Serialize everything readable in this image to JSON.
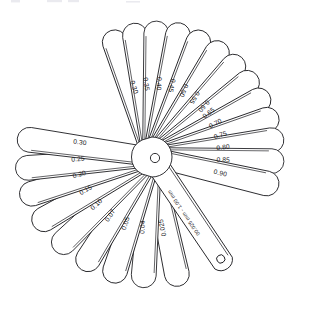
{
  "figure": {
    "object": "feeler-gauge-set",
    "background_color": "#ffffff",
    "line_color": "#1b1b1f",
    "blade_fill": "#ffffff",
    "blade_count": 21,
    "units": "mm"
  },
  "hub": {
    "name": "pivot-hub",
    "hole_label": "pivot-rivet-hole",
    "center_x": 152,
    "center_y": 157
  },
  "range_blade": {
    "name": "range-marking-blade",
    "label": "00.025 mm - 1.00 mm",
    "angle_deg": 56,
    "tip_hole": "blade-tip-hole"
  },
  "blades": [
    {
      "label": "0.30",
      "angle_deg": -108,
      "length": 133,
      "flip": true
    },
    {
      "label": "0.35",
      "angle_deg": -98,
      "length": 135,
      "flip": true
    },
    {
      "label": "0.40",
      "angle_deg": -88,
      "length": 136,
      "flip": true
    },
    {
      "label": "0.45",
      "angle_deg": -78,
      "length": 137,
      "flip": true
    },
    {
      "label": "0.50",
      "angle_deg": -68,
      "length": 136,
      "flip": true
    },
    {
      "label": "0.55",
      "angle_deg": -58,
      "length": 135,
      "flip": true
    },
    {
      "label": "0.60",
      "angle_deg": -48,
      "length": 134,
      "flip": true
    },
    {
      "label": "0.65",
      "angle_deg": -38,
      "length": 133,
      "flip": false
    },
    {
      "label": "0.70",
      "angle_deg": -28,
      "length": 133,
      "flip": false
    },
    {
      "label": "0.75",
      "angle_deg": -18,
      "length": 133,
      "flip": false
    },
    {
      "label": "0.80",
      "angle_deg": -8,
      "length": 133,
      "flip": false
    },
    {
      "label": "0.85",
      "angle_deg": 2,
      "length": 132,
      "flip": false
    },
    {
      "label": "0.90",
      "angle_deg": 13,
      "length": 130,
      "flip": false
    },
    {
      "label": "0.025",
      "angle_deg": 78,
      "length": 132,
      "flip": true
    },
    {
      "label": "0.04",
      "angle_deg": 94,
      "length": 131,
      "flip": true
    },
    {
      "label": "0.05",
      "angle_deg": 108,
      "length": 132,
      "flip": true
    },
    {
      "label": "0.07",
      "angle_deg": 122,
      "length": 133,
      "flip": true
    },
    {
      "label": "0.10",
      "angle_deg": 136,
      "length": 135,
      "flip": true
    },
    {
      "label": "0.15",
      "angle_deg": 150,
      "length": 137,
      "flip": true
    },
    {
      "label": "0.20",
      "angle_deg": 163,
      "length": 138,
      "flip": true
    },
    {
      "label": "0.25",
      "angle_deg": 175,
      "length": 137,
      "flip": true
    },
    {
      "label": "0.30b",
      "angle_deg": -172,
      "length": 136,
      "flip": true
    }
  ],
  "chart_data": {
    "type": "table",
    "categories": [
      "0.025",
      "0.04",
      "0.05",
      "0.07",
      "0.10",
      "0.15",
      "0.20",
      "0.25",
      "0.30",
      "0.35",
      "0.40",
      "0.45",
      "0.50",
      "0.55",
      "0.60",
      "0.65",
      "0.70",
      "0.75",
      "0.80",
      "0.85",
      "0.90"
    ],
    "values": [
      0.025,
      0.04,
      0.05,
      0.07,
      0.1,
      0.15,
      0.2,
      0.25,
      0.3,
      0.35,
      0.4,
      0.45,
      0.5,
      0.55,
      0.6,
      0.65,
      0.7,
      0.75,
      0.8,
      0.85,
      0.9
    ],
    "range_text": "00.025 mm - 1.00 mm",
    "xlabel": "",
    "ylabel": "Thickness (mm)",
    "legend": []
  }
}
